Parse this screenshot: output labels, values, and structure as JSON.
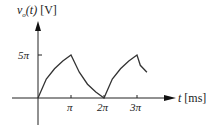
{
  "chart_data": {
    "type": "line",
    "title": "",
    "ylabel": "v_o(t) [V]",
    "ylabel_parts": {
      "var": "v",
      "sub": "o",
      "arg": "(t)",
      "unit": "[V]"
    },
    "xlabel": "t [ms]",
    "xlabel_parts": {
      "var": "t",
      "unit": "[ms]"
    },
    "x_ticks": [
      "π",
      "2π",
      "3π"
    ],
    "y_ticks": [
      "5π"
    ],
    "xlim": [
      0,
      3.6
    ],
    "ylim": [
      0,
      5
    ],
    "grid": false,
    "series": [
      {
        "name": "v_o(t)",
        "description": "charging curve from 0 to 5π over [0, π], decaying to 0 at 2π, charging again to 5π at 3π, then decaying",
        "x_in_pi": [
          0,
          0.25,
          0.5,
          0.75,
          1.0,
          1.25,
          1.5,
          1.75,
          2.0,
          2.25,
          2.5,
          2.75,
          3.0,
          3.1,
          3.3
        ],
        "y_in_pi": [
          0,
          2.2,
          3.4,
          4.3,
          5.0,
          3.0,
          1.6,
          0.7,
          0,
          2.2,
          3.4,
          4.3,
          5.0,
          3.8,
          3.0
        ]
      }
    ]
  }
}
